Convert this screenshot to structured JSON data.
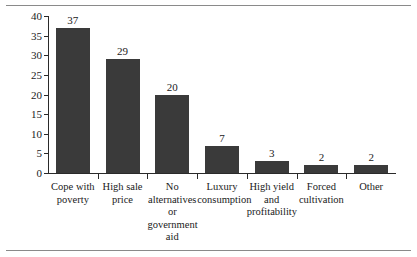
{
  "figure": {
    "background_color": "#ffffff",
    "bar_color": "#3a3a3a",
    "axis_color": "#2a2a2a",
    "rule_color": "#8a8a8a"
  },
  "chart_data": {
    "type": "bar",
    "title": "",
    "subtitle": "",
    "xlabel": "",
    "ylabel": "% poppy farmers interviewed",
    "ylim": [
      0,
      40
    ],
    "yticks": [
      0,
      5,
      10,
      15,
      20,
      25,
      30,
      35,
      40
    ],
    "ytick_labels": [
      "0",
      "5",
      "10",
      "15",
      "20",
      "25",
      "30",
      "35",
      "40"
    ],
    "grid": false,
    "legend": false,
    "legend_position": "none",
    "categories": [
      "Cope with poverty",
      "High sale price",
      "No alternatives or government aid",
      "Luxury consumption",
      "High yield and profitability",
      "Forced cultivation",
      "Other"
    ],
    "category_label_lines": [
      [
        "Cope with",
        "poverty"
      ],
      [
        "High sale",
        "price"
      ],
      [
        "No",
        "alternatives",
        "or",
        "government",
        "aid"
      ],
      [
        "Luxury",
        "consumption"
      ],
      [
        "High yield",
        "and",
        "profitability"
      ],
      [
        "Forced",
        "cultivation"
      ],
      [
        "Other"
      ]
    ],
    "values": [
      37,
      29,
      20,
      7,
      3,
      2,
      2
    ],
    "value_labels": [
      "37",
      "29",
      "20",
      "7",
      "3",
      "2",
      "2"
    ]
  }
}
